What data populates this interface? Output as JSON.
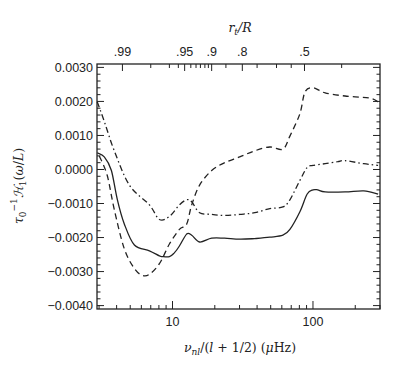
{
  "chart_data": {
    "type": "line",
    "title": "",
    "xlabel": "ν_nl/(l + 1/2) (μHz)",
    "ylabel": "τ0^-1 ℋ1(ω/L)",
    "top_xlabel": "r_t/R",
    "xscale": "log",
    "xlim": [
      2.9,
      300
    ],
    "ylim": [
      -0.0041,
      0.0031
    ],
    "grid": false,
    "legend": null,
    "x_ticks_major": [
      10,
      100
    ],
    "x_tick_labels": [
      "10",
      "100"
    ],
    "y_ticks": [
      0.003,
      0.002,
      0.001,
      0.0,
      -0.001,
      -0.002,
      -0.003,
      -0.004
    ],
    "y_tick_labels": [
      "0.0030",
      "0.0020",
      "0.0010",
      "0.0000",
      "-0.0010",
      "-0.0020",
      "-0.0030",
      "-0.0040"
    ],
    "top_axis_ticks": [
      {
        "label": ".99",
        "x": 4.4
      },
      {
        "label": ".95",
        "x": 12.2
      },
      {
        "label": ".9",
        "x": 19.0
      },
      {
        "label": ".8",
        "x": 31.4
      },
      {
        "label": ".5",
        "x": 87.0
      }
    ],
    "series": [
      {
        "name": "solid",
        "style": "solid",
        "x": [
          2.91,
          3.27,
          3.67,
          4.05,
          4.54,
          5.35,
          6.85,
          8.07,
          8.48,
          9.5,
          10.3,
          11.2,
          12.6,
          13.7,
          15.6,
          19.0,
          23.5,
          30.1,
          38.5,
          49.3,
          61.1,
          68.5,
          80.7,
          91,
          100,
          108,
          122,
          169,
          230,
          291
        ],
        "values": [
          0.00049,
          0.00037,
          -3e-05,
          -0.00089,
          -0.0016,
          -0.00222,
          -0.00239,
          -0.00254,
          -0.00256,
          -0.00256,
          -0.00245,
          -0.00225,
          -0.0019,
          -0.00193,
          -0.00213,
          -0.00202,
          -0.00202,
          -0.00205,
          -0.00203,
          -0.00199,
          -0.00193,
          -0.00176,
          -0.00124,
          -0.00072,
          -0.0006,
          -0.0006,
          -0.00066,
          -0.00066,
          -0.00063,
          -0.00072
        ]
      },
      {
        "name": "dashed",
        "style": "dashed",
        "x": [
          3.01,
          3.43,
          3.85,
          4.54,
          5.35,
          6.1,
          6.85,
          8.07,
          9.5,
          11.2,
          12.6,
          13.7,
          15.6,
          19.0,
          23.5,
          30.1,
          38.5,
          49.3,
          61.1,
          68.5,
          80.7,
          87.7,
          100,
          122,
          169,
          250,
          291
        ],
        "values": [
          0.0004,
          -0.00017,
          -0.00118,
          -0.00233,
          -0.00291,
          -0.00311,
          -0.00308,
          -0.00277,
          -0.00219,
          -0.00176,
          -0.00161,
          -0.00104,
          -0.00046,
          -3e-05,
          0.0002,
          0.00037,
          0.00055,
          0.00066,
          0.0006,
          0.00098,
          0.00164,
          0.00228,
          0.0024,
          0.00225,
          0.00216,
          0.0021,
          0.00199
        ]
      },
      {
        "name": "dash-dot",
        "style": "dashdot",
        "x": [
          2.91,
          3.27,
          3.85,
          4.93,
          6.85,
          8.07,
          9.5,
          11.2,
          12.6,
          13.7,
          15.6,
          19.0,
          23.5,
          30.1,
          38.5,
          49.3,
          61.1,
          68.5,
          80.7,
          91,
          100,
          122,
          150,
          169,
          230,
          291
        ],
        "values": [
          0.00199,
          0.00141,
          0.00055,
          -0.00046,
          -0.00104,
          -0.00147,
          -0.00138,
          -0.00104,
          -0.00089,
          -0.00095,
          -0.00127,
          -0.00132,
          -0.00135,
          -0.00132,
          -0.00127,
          -0.00115,
          -0.0011,
          -0.00089,
          -0.00032,
          6e-05,
          0.00012,
          0.00017,
          0.00023,
          0.00026,
          0.00017,
          0.00012
        ]
      }
    ]
  }
}
